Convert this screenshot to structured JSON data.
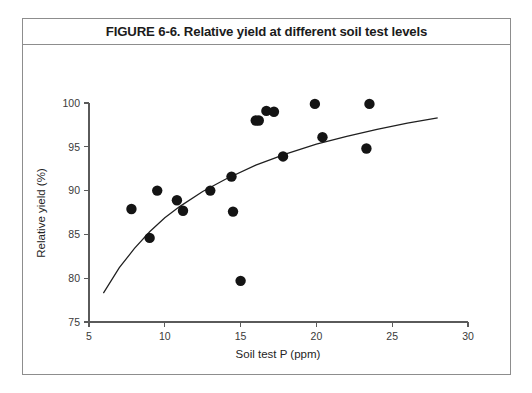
{
  "figure": {
    "title": "FIGURE 6-6. Relative yield at different soil test levels",
    "border_color": "#8d8d8d",
    "background": "#ffffff"
  },
  "chart_data": {
    "type": "scatter",
    "title": "FIGURE 6-6. Relative yield at different soil test levels",
    "xlabel": "Soil test P (ppm)",
    "ylabel": "Relative yield (%)",
    "xlim": [
      5,
      30
    ],
    "ylim": [
      75,
      100
    ],
    "xticks": [
      5,
      10,
      15,
      20,
      25,
      30
    ],
    "xtick_labels": [
      "5",
      "10",
      "15",
      "20",
      "25",
      "30"
    ],
    "yticks": [
      75,
      80,
      85,
      90,
      95,
      100
    ],
    "ytick_labels": [
      "75",
      "80",
      "85",
      "90",
      "95",
      "100"
    ],
    "grid": false,
    "legend": null,
    "marker_color": "#141414",
    "marker_size": 5.2,
    "series": [
      {
        "name": "Observed relative yield",
        "x": [
          7.8,
          9.0,
          9.5,
          10.8,
          11.2,
          13.0,
          14.4,
          14.5,
          15.0,
          16.0,
          16.2,
          16.7,
          17.2,
          17.8,
          19.9,
          20.4,
          23.3,
          23.5
        ],
        "y": [
          87.9,
          84.6,
          90.0,
          88.9,
          87.7,
          90.0,
          91.6,
          87.6,
          79.7,
          98.0,
          98.0,
          99.1,
          99.0,
          93.9,
          99.9,
          96.1,
          94.8,
          99.9
        ]
      }
    ],
    "fit_curve": {
      "name": "Mitscherlich response curve",
      "color": "#1f1f1f",
      "x": [
        5.95,
        7.0,
        8.0,
        9.0,
        10.0,
        11.0,
        12.5,
        14.0,
        16.0,
        18.0,
        20.0,
        22.0,
        24.0,
        26.0,
        28.0
      ],
      "y": [
        78.3,
        81.2,
        83.4,
        85.3,
        86.9,
        88.2,
        89.9,
        91.3,
        92.9,
        94.2,
        95.3,
        96.2,
        97.0,
        97.7,
        98.3
      ]
    }
  }
}
